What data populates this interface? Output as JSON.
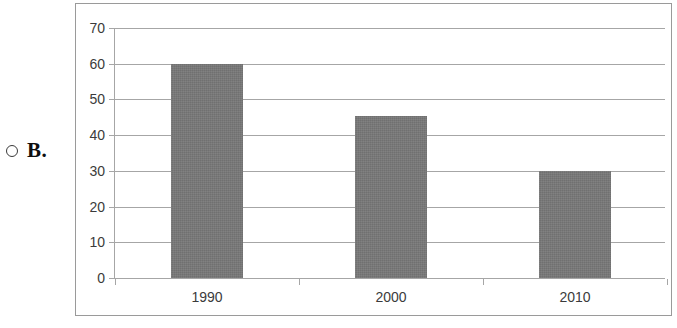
{
  "choice": {
    "marker_icon": "radio-unselected-icon",
    "letter": "B."
  },
  "chart_data": {
    "type": "bar",
    "title": "",
    "subtitle": "",
    "xlabel": "",
    "ylabel": "",
    "categories": [
      "1990",
      "2000",
      "2010"
    ],
    "values": [
      60,
      45.5,
      30
    ],
    "series": [
      {
        "name": "",
        "values": [
          60,
          45.5,
          30
        ]
      }
    ],
    "ylim": [
      0,
      70
    ],
    "yticks": [
      0,
      10,
      20,
      30,
      40,
      50,
      60,
      70
    ],
    "ytick_labels": [
      "0",
      "10",
      "20",
      "30",
      "40",
      "50",
      "60",
      "70"
    ],
    "xtick_labels": [
      "1990",
      "2000",
      "2010"
    ],
    "grid": true,
    "grid_axis": "y",
    "legend": false,
    "legend_position": "none",
    "bar_color": "#787878",
    "gridline_color": "#a6a6a6",
    "axis_color": "#a6a6a6",
    "label_color": "#3b3b3b",
    "frame_border_color": "#9a9a9a",
    "background_color": "#ffffff"
  }
}
